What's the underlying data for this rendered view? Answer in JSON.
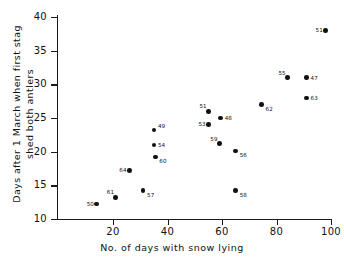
{
  "chart_data": {
    "type": "scatter",
    "title": "",
    "xlabel": "No. of days with snow lying",
    "ylabel": "Days after 1 March when first stag\nshed both antlers",
    "xlim": [
      8,
      108
    ],
    "ylim": [
      10,
      40
    ],
    "xticks": [
      20,
      40,
      60,
      80,
      100
    ],
    "yticks": [
      10,
      15,
      20,
      25,
      30,
      35,
      40
    ],
    "grid": false,
    "legend": "none",
    "point_label_note": "each marker is annotated with a stag identification number",
    "points": [
      {
        "label": "50",
        "x": 14.0,
        "y": 12.2,
        "label_pos": "left"
      },
      {
        "label": "61",
        "x": 21.0,
        "y": 13.2,
        "label_pos": "above-left"
      },
      {
        "label": "57",
        "x": 31.0,
        "y": 14.2,
        "label_pos": "below-right"
      },
      {
        "label": "64",
        "x": 26.0,
        "y": 17.2,
        "label_pos": "left"
      },
      {
        "label": "60",
        "x": 35.5,
        "y": 19.2,
        "label_pos": "below-right"
      },
      {
        "label": "54",
        "x": 35.0,
        "y": 21.0,
        "label_pos": "right"
      },
      {
        "label": "49",
        "x": 35.0,
        "y": 23.2,
        "label_pos": "above-right"
      },
      {
        "label": "58",
        "x": 65.0,
        "y": 14.2,
        "label_pos": "below-right"
      },
      {
        "label": "56",
        "x": 65.0,
        "y": 20.1,
        "label_pos": "below-right"
      },
      {
        "label": "59",
        "x": 59.0,
        "y": 21.2,
        "label_pos": "above-left"
      },
      {
        "label": "53",
        "x": 55.0,
        "y": 24.0,
        "label_pos": "left"
      },
      {
        "label": "48",
        "x": 59.5,
        "y": 25.0,
        "label_pos": "right"
      },
      {
        "label": "51",
        "x": 55.0,
        "y": 26.0,
        "label_pos": "above-left"
      },
      {
        "label": "62",
        "x": 74.5,
        "y": 27.0,
        "label_pos": "below-right"
      },
      {
        "label": "63",
        "x": 91.0,
        "y": 28.0,
        "label_pos": "right"
      },
      {
        "label": "55",
        "x": 84.0,
        "y": 31.0,
        "label_pos": "above-left"
      },
      {
        "label": "47",
        "x": 91.0,
        "y": 31.0,
        "label_pos": "right"
      },
      {
        "label": "51",
        "x": 98.0,
        "y": 38.0,
        "label_pos": "left"
      }
    ]
  },
  "axes": {
    "y_title_line1": "Days after 1 March when first stag",
    "y_title_line2": "shed both antlers",
    "y_title": "Days after 1 March when first stag\nshed both antlers",
    "x_title": "No. of days with snow lying"
  },
  "colors": {
    "marker": "#111111",
    "axis": "#1a1a1a",
    "background": "#ffffff",
    "text": "#111111"
  }
}
